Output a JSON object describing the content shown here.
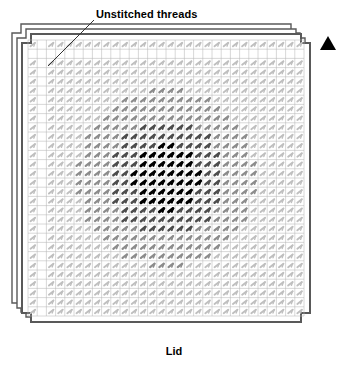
{
  "diagram": {
    "title_callout": "Unstitched threads",
    "caption": "Lid",
    "pin1_marker": "solid-triangle-up",
    "colors": {
      "outline": "#595959",
      "grid": "#b8b8b8",
      "stitch_dark": "#000000",
      "stitch_mid": "#4d4d4d",
      "stitch_light": "#8c8c8c",
      "stitch_faint": "#bfbfbf",
      "background": "#ffffff",
      "marker": "#000000",
      "leader": "#333333"
    }
  },
  "chart_data": {
    "type": "heatmap",
    "xlabel": "",
    "ylabel": "",
    "grid": {
      "columns": 30,
      "rows": 30,
      "cell_size_px": 9.2,
      "origin_x_px": 28,
      "origin_y_px": 40
    },
    "axis_ranges": {
      "x": [
        0,
        30
      ],
      "y": [
        0,
        30
      ]
    },
    "grid_on": true,
    "legend_position": "none",
    "intensity_levels": [
      {
        "name": "dark",
        "color": "#000000",
        "radius_fraction": 0.17
      },
      {
        "name": "mid",
        "color": "#4d4d4d",
        "radius_fraction": 0.3
      },
      {
        "name": "light",
        "color": "#8c8c8c",
        "radius_fraction": 0.46
      },
      {
        "name": "faint",
        "color": "#bfbfbf",
        "radius_fraction": 1.0
      }
    ],
    "center_cell": {
      "col": 15,
      "row": 15
    },
    "stitch_angle_deg": -38,
    "unstitched_regions": [
      {
        "name": "left-margin-column",
        "cols": [
          1,
          2
        ],
        "rows": [
          0,
          30
        ]
      },
      {
        "name": "top-margin-row",
        "cols": [
          0,
          30
        ],
        "rows": [
          1,
          2
        ]
      }
    ],
    "annotations": [
      {
        "text": "Unstitched threads",
        "anchor_px": {
          "x": 96,
          "y": 15
        },
        "leader_from_px": {
          "x": 94,
          "y": 20
        },
        "leader_to_px": {
          "x": 48,
          "y": 66
        }
      },
      {
        "text": "Lid",
        "anchor_px": {
          "x": 174,
          "y": 352
        }
      }
    ],
    "outline": {
      "type": "stepped-square-stack",
      "layers": 3,
      "layer_offset_px": 5,
      "corner_step_px": 9
    }
  }
}
